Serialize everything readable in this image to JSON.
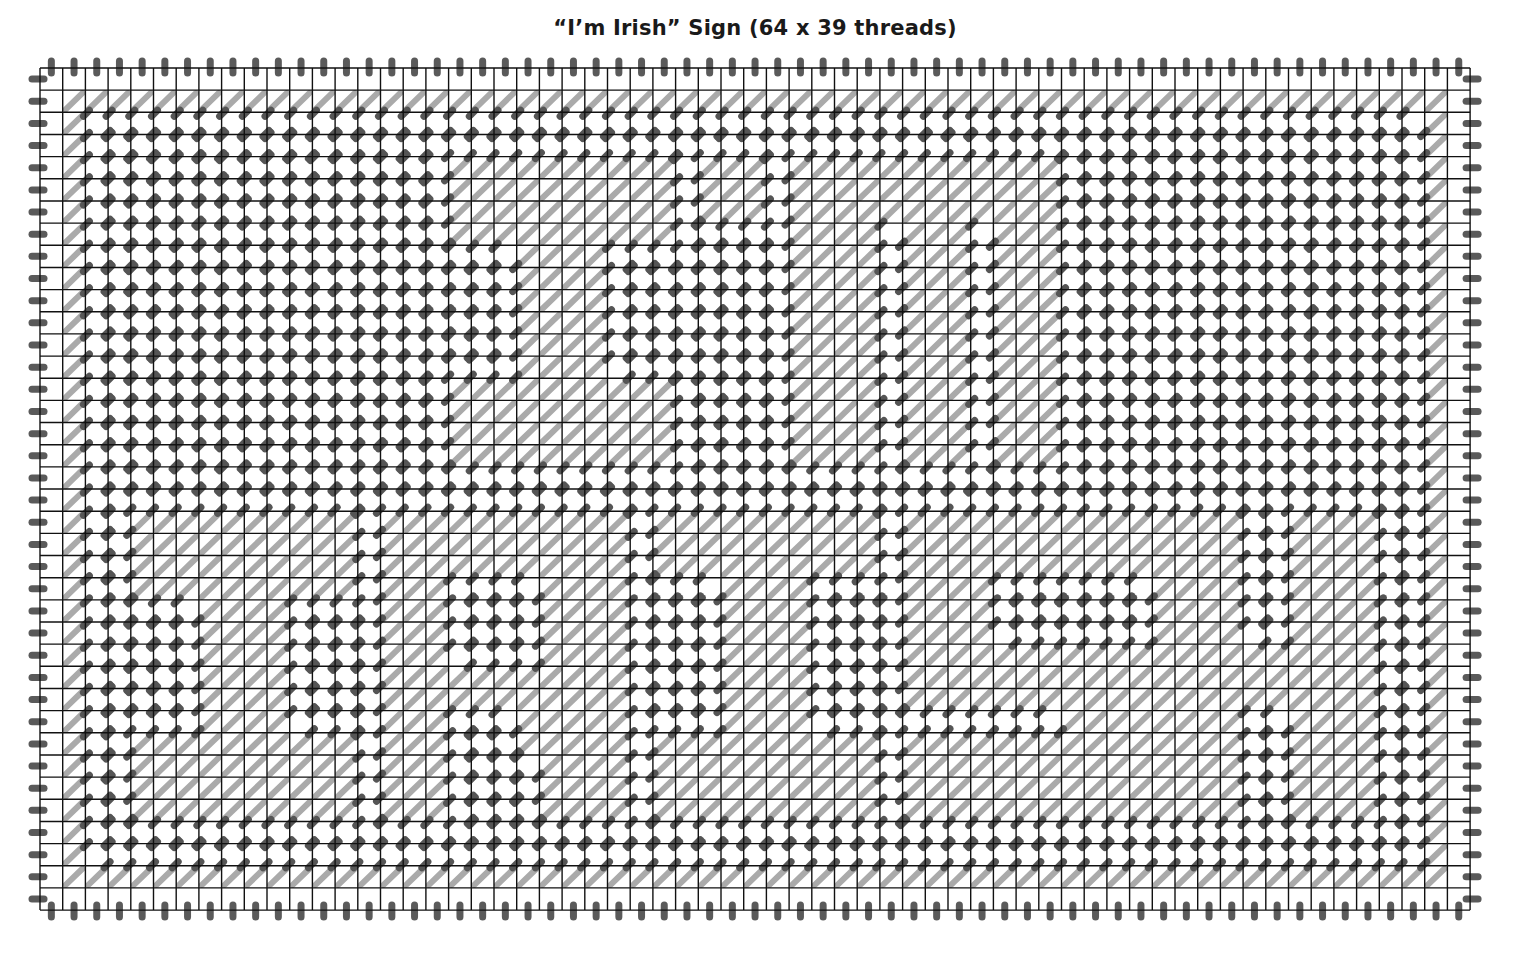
{
  "title": "“I’m Irish” Sign (64 x 39 threads)",
  "canvas": {
    "threads_wide": 64,
    "threads_high": 39,
    "origin_x": 40,
    "origin_y": 68,
    "cell_w": 22.7,
    "cell_h": 22.16
  },
  "colors": {
    "grid_line": "#111111",
    "background_stitch": "#555555",
    "letter_stitch": "#aaaaaa",
    "overcast_edge": "#5a5a5a",
    "paper": "#ffffff"
  },
  "legend_note": "Dark stitches = background; light diagonal stitches = letters and border; outline = dashed light backstitch",
  "words": [
    {
      "text": "I'm",
      "rows": [
        4,
        17
      ]
    },
    {
      "text": "IRISH",
      "rows": [
        20,
        33
      ]
    }
  ],
  "fill_rects": [
    {
      "name": "border-top",
      "c0": 1,
      "c1": 61,
      "r0": 1,
      "r1": 1
    },
    {
      "name": "border-bottom",
      "c0": 1,
      "c1": 61,
      "r0": 36,
      "r1": 36
    },
    {
      "name": "border-left",
      "c0": 1,
      "c1": 1,
      "r0": 1,
      "r1": 36
    },
    {
      "name": "border-right",
      "c0": 61,
      "c1": 61,
      "r0": 1,
      "r1": 36
    },
    {
      "name": "upper-I-top",
      "c0": 18,
      "c1": 27,
      "r0": 4,
      "r1": 7
    },
    {
      "name": "upper-I-stem",
      "c0": 21,
      "c1": 24,
      "r0": 8,
      "r1": 13
    },
    {
      "name": "upper-I-bottom",
      "c0": 18,
      "c1": 27,
      "r0": 14,
      "r1": 17
    },
    {
      "name": "apostrophe",
      "c0": 29,
      "c1": 31,
      "r0": 4,
      "r1": 6
    },
    {
      "name": "m-top",
      "c0": 33,
      "c1": 44,
      "r0": 4,
      "r1": 6
    },
    {
      "name": "m-leg-1",
      "c0": 33,
      "c1": 36,
      "r0": 7,
      "r1": 17
    },
    {
      "name": "m-leg-2",
      "c0": 38,
      "c1": 40,
      "r0": 7,
      "r1": 17
    },
    {
      "name": "m-leg-3",
      "c0": 42,
      "c1": 44,
      "r0": 7,
      "r1": 17
    },
    {
      "name": "lower-I-top",
      "c0": 4,
      "c1": 13,
      "r0": 20,
      "r1": 23
    },
    {
      "name": "lower-I-stem",
      "c0": 7,
      "c1": 10,
      "r0": 24,
      "r1": 29
    },
    {
      "name": "lower-I-bottom",
      "c0": 4,
      "c1": 13,
      "r0": 30,
      "r1": 33
    },
    {
      "name": "R-stem",
      "c0": 15,
      "c1": 17,
      "r0": 20,
      "r1": 33
    },
    {
      "name": "R-top",
      "c0": 18,
      "c1": 25,
      "r0": 20,
      "r1": 22
    },
    {
      "name": "R-bowl-right",
      "c0": 22,
      "c1": 25,
      "r0": 23,
      "r1": 27
    },
    {
      "name": "R-middle",
      "c0": 18,
      "c1": 21,
      "r0": 27,
      "r1": 28
    },
    {
      "name": "R-leg-diag",
      "c0": 21,
      "c1": 21,
      "r0": 29,
      "r1": 30
    },
    {
      "name": "R-leg",
      "c0": 22,
      "c1": 25,
      "r0": 28,
      "r1": 33
    },
    {
      "name": "I2-top",
      "c0": 27,
      "c1": 36,
      "r0": 20,
      "r1": 22
    },
    {
      "name": "I2-stem",
      "c0": 30,
      "c1": 33,
      "r0": 23,
      "r1": 29
    },
    {
      "name": "I2-bottom",
      "c0": 27,
      "c1": 36,
      "r0": 30,
      "r1": 33
    },
    {
      "name": "S-top",
      "c0": 38,
      "c1": 48,
      "r0": 20,
      "r1": 22
    },
    {
      "name": "S-left",
      "c0": 38,
      "c1": 41,
      "r0": 23,
      "r1": 25
    },
    {
      "name": "S-middle",
      "c0": 38,
      "c1": 48,
      "r0": 26,
      "r1": 28
    },
    {
      "name": "S-right",
      "c0": 45,
      "c1": 48,
      "r0": 29,
      "r1": 29
    },
    {
      "name": "S-bottom",
      "c0": 38,
      "c1": 48,
      "r0": 30,
      "r1": 33
    },
    {
      "name": "H-left",
      "c0": 49,
      "c1": 52,
      "r0": 20,
      "r1": 33
    },
    {
      "name": "H-bar",
      "c0": 53,
      "c1": 54,
      "r0": 26,
      "r1": 28
    },
    {
      "name": "H-right",
      "c0": 55,
      "c1": 58,
      "r0": 20,
      "r1": 33
    }
  ]
}
